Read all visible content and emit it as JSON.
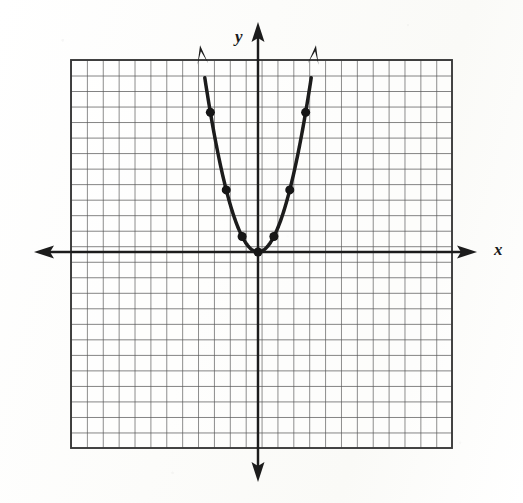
{
  "figure": {
    "kind": "coordinate-grid-graph",
    "background_color": "#fdfdfc",
    "ink_color": "#1b1b1b",
    "grid_color": "#555555"
  },
  "axes": {
    "x_label": "x",
    "y_label": "y",
    "x_axis_name": "x-axis",
    "y_axis_name": "y-axis",
    "arrowheads": "both-ends",
    "origin_px": {
      "x": 258,
      "y": 252
    },
    "cell_px": 15.88
  },
  "grid": {
    "left_px": 71,
    "top_px": 60,
    "right_px": 452,
    "bottom_px": 448,
    "columns": 24,
    "rows": 25,
    "x_min": -11.8,
    "x_max": 12.2,
    "y_min": -12.3,
    "y_max": 12.1,
    "show_tick_labels": false
  },
  "chart_data": {
    "type": "line",
    "title": "",
    "subtitle": "",
    "xlabel": "x",
    "ylabel": "y",
    "xlim": [
      -11.8,
      12.2
    ],
    "ylim": [
      -12.3,
      12.1
    ],
    "grid": true,
    "legend": "none",
    "grid_spacing": 1,
    "series": [
      {
        "name": "y = x^2",
        "equation": "y = x²",
        "marked_points": [
          {
            "x": -3,
            "y": 9
          },
          {
            "x": -2,
            "y": 4
          },
          {
            "x": -1,
            "y": 1
          },
          {
            "x": 0,
            "y": 0
          },
          {
            "x": 1,
            "y": 1
          },
          {
            "x": 2,
            "y": 4
          },
          {
            "x": 3,
            "y": 9
          }
        ],
        "curve_x_range": [
          -3.35,
          3.35
        ],
        "end_arrows": [
          "up-left",
          "up-right"
        ],
        "vertex": {
          "x": 0,
          "y": 0
        },
        "opens": "upward"
      }
    ],
    "annotations": []
  }
}
